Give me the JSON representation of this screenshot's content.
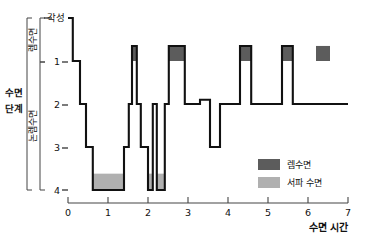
{
  "chart_data": {
    "type": "area",
    "title": "",
    "subtitle": "",
    "xlabel": "수면 시간",
    "ylabel": "수면 단계",
    "xlim": [
      0,
      7
    ],
    "ylim_stages": [
      "각성",
      "1",
      "2",
      "3",
      "4"
    ],
    "grid": false,
    "legend_position": "bottom-right",
    "x_ticks": [
      "0",
      "1",
      "2",
      "3",
      "4",
      "5",
      "6",
      "7"
    ],
    "y_ticks": [
      "각성",
      "1",
      "2",
      "3",
      "4"
    ],
    "y_bracket_groups": [
      {
        "label": "렘수면",
        "from": "각성",
        "to": "1"
      },
      {
        "label": "논렘수면",
        "from": "1",
        "to": "4"
      }
    ],
    "legend": [
      {
        "label": "렘수면",
        "color": "#5c5c5c"
      },
      {
        "label": "서파 수면",
        "color": "#b0b0b0"
      }
    ],
    "series": [
      {
        "name": "수면 단계",
        "note": "hypnogram step trace; stage value vs hours asleep",
        "steps": [
          {
            "x0": 0.0,
            "x1": 0.12,
            "stage": 0.0
          },
          {
            "x0": 0.12,
            "x1": 0.3,
            "stage": 1.0
          },
          {
            "x0": 0.3,
            "x1": 0.45,
            "stage": 2.0
          },
          {
            "x0": 0.45,
            "x1": 0.62,
            "stage": 3.0
          },
          {
            "x0": 0.62,
            "x1": 1.4,
            "stage": 4.0
          },
          {
            "x0": 1.4,
            "x1": 1.52,
            "stage": 3.0
          },
          {
            "x0": 1.52,
            "x1": 1.6,
            "stage": 2.0
          },
          {
            "x0": 1.6,
            "x1": 1.72,
            "stage": 0.65
          },
          {
            "x0": 1.72,
            "x1": 1.82,
            "stage": 2.0
          },
          {
            "x0": 1.82,
            "x1": 2.0,
            "stage": 3.0
          },
          {
            "x0": 2.0,
            "x1": 2.12,
            "stage": 4.0
          },
          {
            "x0": 2.12,
            "x1": 2.22,
            "stage": 2.0
          },
          {
            "x0": 2.22,
            "x1": 2.42,
            "stage": 4.0
          },
          {
            "x0": 2.42,
            "x1": 2.52,
            "stage": 2.0
          },
          {
            "x0": 2.52,
            "x1": 2.92,
            "stage": 0.65
          },
          {
            "x0": 2.92,
            "x1": 3.3,
            "stage": 2.0
          },
          {
            "x0": 3.3,
            "x1": 3.55,
            "stage": 1.9
          },
          {
            "x0": 3.55,
            "x1": 3.8,
            "stage": 3.0
          },
          {
            "x0": 3.8,
            "x1": 4.3,
            "stage": 2.0
          },
          {
            "x0": 4.3,
            "x1": 4.58,
            "stage": 0.65
          },
          {
            "x0": 4.58,
            "x1": 5.35,
            "stage": 2.0
          },
          {
            "x0": 5.35,
            "x1": 5.62,
            "stage": 0.65
          },
          {
            "x0": 5.62,
            "x1": 6.2,
            "stage": 2.0
          },
          {
            "x0": 6.2,
            "x1": 7.0,
            "stage": 2.0
          }
        ]
      }
    ],
    "rem_episodes": [
      {
        "x0": 1.6,
        "x1": 1.72,
        "from_stage": 0.65,
        "to_stage": 1.0
      },
      {
        "x0": 2.52,
        "x1": 2.92,
        "from_stage": 0.65,
        "to_stage": 1.0
      },
      {
        "x0": 4.3,
        "x1": 4.58,
        "from_stage": 0.65,
        "to_stage": 1.0
      },
      {
        "x0": 5.35,
        "x1": 5.62,
        "from_stage": 0.65,
        "to_stage": 1.0
      },
      {
        "x0": 6.2,
        "x1": 6.55,
        "from_stage": 0.65,
        "to_stage": 1.0
      }
    ],
    "slow_wave_episodes": [
      {
        "x0": 0.62,
        "x1": 1.4,
        "from_stage": 3.62,
        "to_stage": 4.0
      },
      {
        "x0": 2.0,
        "x1": 2.12,
        "from_stage": 3.62,
        "to_stage": 4.0
      },
      {
        "x0": 2.22,
        "x1": 2.42,
        "from_stage": 3.62,
        "to_stage": 4.0
      }
    ]
  },
  "axis": {
    "y_title": "수면 단계",
    "awake_label": "각성",
    "stage_1": "1",
    "stage_2": "2",
    "stage_3": "3",
    "stage_4": "4",
    "bracket_rem": "렘수면",
    "bracket_nrem": "논렘수면",
    "x_title": "수면 시간",
    "x0": "0",
    "x1": "1",
    "x2": "2",
    "x3": "3",
    "x4": "4",
    "x5": "5",
    "x6": "6",
    "x7": "7"
  },
  "legend": {
    "rem_label": "렘수면",
    "sws_label": "서파 수면",
    "rem_color": "#5c5c5c",
    "sws_color": "#b0b0b0"
  }
}
